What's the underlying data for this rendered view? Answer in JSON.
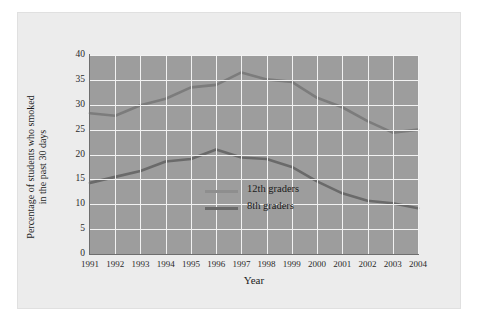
{
  "chart_data": {
    "type": "line",
    "title": "",
    "xlabel": "Year",
    "ylabel": "Percentage of students who smoked in the past 30 days",
    "ylabel_line1": "Percentage of students who smoked",
    "ylabel_line2": "in the past 30 days",
    "categories": [
      "1991",
      "1992",
      "1993",
      "1994",
      "1995",
      "1996",
      "1997",
      "1998",
      "1999",
      "2000",
      "2001",
      "2002",
      "2003",
      "2004"
    ],
    "x": [
      1991,
      1992,
      1993,
      1994,
      1995,
      1996,
      1997,
      1998,
      1999,
      2000,
      2001,
      2002,
      2003,
      2004
    ],
    "ylim": [
      0,
      40
    ],
    "yticks": [
      0,
      5,
      10,
      15,
      20,
      25,
      30,
      35,
      40
    ],
    "ytick_labels": [
      "0",
      "5",
      "10",
      "15",
      "20",
      "25",
      "30",
      "35",
      "40"
    ],
    "grid": true,
    "grid_color": "#f2f2f2",
    "plot_background": "#9d9d9d",
    "figure_background": "#ececec",
    "legend_position": "center",
    "series": [
      {
        "name": "12th graders",
        "color": "#7c7c7c",
        "values": [
          28.3,
          27.8,
          29.9,
          31.2,
          33.5,
          34.0,
          36.5,
          35.1,
          34.6,
          31.4,
          29.5,
          26.7,
          24.4,
          25.0
        ]
      },
      {
        "name": "8th graders",
        "color": "#6a6a6a",
        "values": [
          14.3,
          15.5,
          16.7,
          18.6,
          19.1,
          21.0,
          19.4,
          19.1,
          17.5,
          14.6,
          12.2,
          10.7,
          10.2,
          9.2
        ]
      }
    ]
  },
  "legend": {
    "items": [
      {
        "label": "12th graders",
        "color": "#8e8e8e"
      },
      {
        "label": "8th graders",
        "color": "#6a6a6a"
      }
    ]
  }
}
